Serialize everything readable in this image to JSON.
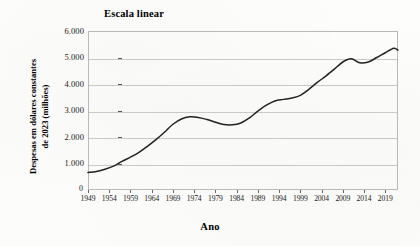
{
  "chart_data": {
    "type": "line",
    "title": "Escala linear",
    "xlabel": "Ano",
    "ylabel_line1": "Despesas em dólares constantes",
    "ylabel_line2": "de 2023 (milhões)",
    "ylabel": "Despesas em dólares constantes de 2023 (milhões)",
    "grid": true,
    "legend": "none",
    "origin_label": "0",
    "xlim": [
      1949,
      2022
    ],
    "ylim": [
      0,
      6000
    ],
    "ytick_labels": [
      "6.000",
      "5.000",
      "4.000",
      "3.000",
      "2.000",
      "1.000"
    ],
    "ytick_values": [
      6000,
      5000,
      4000,
      3000,
      2000,
      1000
    ],
    "xtick_labels": [
      "1949",
      "1954",
      "1959",
      "1964",
      "1969",
      "1974",
      "1979",
      "1984",
      "1989",
      "1994",
      "1999",
      "2004",
      "2009",
      "2014",
      "2019"
    ],
    "xtick_values": [
      1949,
      1954,
      1959,
      1964,
      1969,
      1974,
      1979,
      1984,
      1989,
      1994,
      1999,
      2004,
      2009,
      2014,
      2019
    ],
    "series": [
      {
        "name": "Despesas",
        "color": "#222222",
        "x": [
          1949,
          1951,
          1953,
          1955,
          1957,
          1959,
          1961,
          1963,
          1965,
          1967,
          1969,
          1971,
          1973,
          1975,
          1977,
          1979,
          1981,
          1983,
          1985,
          1987,
          1989,
          1991,
          1993,
          1995,
          1997,
          1999,
          2001,
          2003,
          2005,
          2007,
          2009,
          2011,
          2013,
          2015,
          2017,
          2019,
          2021,
          2022
        ],
        "values": [
          660,
          700,
          780,
          900,
          1080,
          1240,
          1420,
          1650,
          1900,
          2180,
          2480,
          2680,
          2760,
          2740,
          2660,
          2560,
          2470,
          2460,
          2530,
          2720,
          2980,
          3200,
          3360,
          3420,
          3470,
          3570,
          3800,
          4060,
          4300,
          4560,
          4830,
          4950,
          4800,
          4830,
          5000,
          5180,
          5350,
          5280
        ]
      }
    ]
  }
}
